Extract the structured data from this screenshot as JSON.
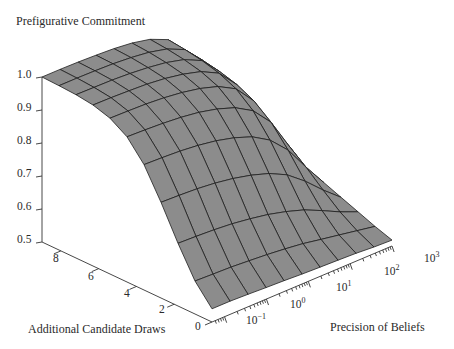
{
  "chart_data": {
    "type": "surface3d",
    "title": "Prefigurative Commitment",
    "zlabel": "Prefigurative Commitment",
    "xlabel": "Precision of Beliefs",
    "ylabel": "Additional Candidate Draws",
    "zlim": [
      0.5,
      1.0
    ],
    "z_ticks": [
      "1.0",
      "0.9",
      "0.8",
      "0.7",
      "0.6",
      "0.5"
    ],
    "y_ticks": [
      "0",
      "2",
      "4",
      "6",
      "8"
    ],
    "x_ticks": [
      {
        "base": "10",
        "exp": "−1"
      },
      {
        "base": "10",
        "exp": "0"
      },
      {
        "base": "10",
        "exp": "1"
      },
      {
        "base": "10",
        "exp": "2"
      },
      {
        "base": "10",
        "exp": "3"
      }
    ],
    "x_scale": "log",
    "x_range_log10": [
      -1.3,
      3.0
    ],
    "y_range": [
      0,
      9
    ],
    "surface_color": "#8c8c8c",
    "mesh_line_color": "#1e1e1e",
    "grid_cols_x": 10,
    "grid_rows_y": 10,
    "z_grid": [
      [
        0.54,
        0.54,
        0.538,
        0.535,
        0.533,
        0.53,
        0.528,
        0.526,
        0.524,
        0.52,
        0.518
      ],
      [
        0.6,
        0.598,
        0.596,
        0.592,
        0.588,
        0.582,
        0.575,
        0.565,
        0.555,
        0.545,
        0.535
      ],
      [
        0.69,
        0.688,
        0.685,
        0.68,
        0.672,
        0.662,
        0.648,
        0.63,
        0.605,
        0.578,
        0.555
      ],
      [
        0.79,
        0.788,
        0.785,
        0.779,
        0.77,
        0.757,
        0.739,
        0.712,
        0.67,
        0.62,
        0.575
      ],
      [
        0.88,
        0.878,
        0.875,
        0.869,
        0.86,
        0.846,
        0.826,
        0.793,
        0.74,
        0.665,
        0.595
      ],
      [
        0.94,
        0.938,
        0.935,
        0.93,
        0.922,
        0.909,
        0.89,
        0.858,
        0.8,
        0.705,
        0.612
      ],
      [
        0.972,
        0.971,
        0.969,
        0.965,
        0.958,
        0.947,
        0.93,
        0.9,
        0.84,
        0.735,
        0.625
      ],
      [
        0.988,
        0.987,
        0.985,
        0.982,
        0.976,
        0.966,
        0.951,
        0.923,
        0.865,
        0.755,
        0.635
      ],
      [
        0.995,
        0.994,
        0.993,
        0.99,
        0.985,
        0.977,
        0.963,
        0.937,
        0.88,
        0.768,
        0.642
      ],
      [
        0.998,
        0.998,
        0.997,
        0.995,
        0.991,
        0.984,
        0.971,
        0.946,
        0.89,
        0.776,
        0.646
      ],
      [
        1.0,
        1.0,
        0.999,
        0.997,
        0.994,
        0.988,
        0.976,
        0.952,
        0.896,
        0.78,
        0.648
      ]
    ]
  }
}
